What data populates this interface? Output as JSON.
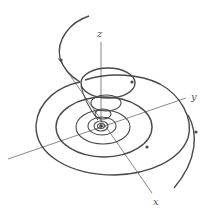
{
  "diagram": {
    "type": "3d-spiral-trajectory",
    "axes": {
      "x_label": "x",
      "y_label": "y",
      "z_label": "z"
    },
    "colors": {
      "trajectory": "#4a4a4a",
      "axis": "#6a6a6a",
      "background": "#ffffff"
    },
    "direction_markers": 4
  }
}
